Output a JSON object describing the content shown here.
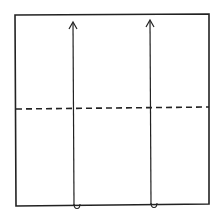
{
  "diagram": {
    "type": "origami-fold-step",
    "paper": {
      "x": 15,
      "y": 15,
      "width": 194,
      "height": 190
    },
    "fold_line": {
      "style": "dashed",
      "y": 108,
      "label": "valley fold"
    },
    "arrows": [
      {
        "name": "left-fold-arrow",
        "x": 74,
        "from_y": 205,
        "to_y": 23,
        "direction": "up"
      },
      {
        "name": "right-fold-arrow",
        "x": 151,
        "from_y": 205,
        "to_y": 21,
        "direction": "up"
      }
    ],
    "stroke_color": "#222222",
    "background": "#ffffff"
  }
}
